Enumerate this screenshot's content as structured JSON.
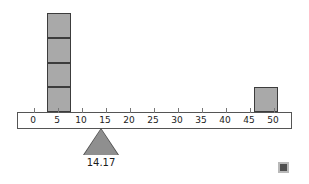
{
  "figure": {
    "type": "balance-beam-dotplot",
    "fulcrum_label": "14.17",
    "corner_marker": "filled-square-marker"
  },
  "axis": {
    "ticks": [
      "0",
      "5",
      "10",
      "15",
      "20",
      "25",
      "30",
      "35",
      "40",
      "45",
      "50"
    ],
    "min": 0,
    "max": 50,
    "step": 5
  },
  "chart_data": {
    "type": "bar",
    "title": "",
    "subtitle": "",
    "xlabel": "",
    "ylabel": "",
    "xlim": [
      -3,
      53
    ],
    "ylim": [
      0,
      4
    ],
    "grid": false,
    "legend": null,
    "categories": [
      "5",
      "48"
    ],
    "values": [
      4,
      1
    ],
    "blocks": [
      {
        "name": "stack-left",
        "x_center": 5.5,
        "x_start": 3,
        "x_end": 8,
        "count": 4
      },
      {
        "name": "stack-right",
        "x_center": 48.5,
        "x_start": 46,
        "x_end": 51,
        "count": 1
      }
    ],
    "balance_point": 14.17,
    "annotations": [
      {
        "name": "fulcrum-value",
        "text": "14.17",
        "x": 14.17
      }
    ]
  },
  "colors": {
    "block_fill": "#a9a9a9",
    "block_stroke": "#3c3c3c",
    "beam_stroke": "#555555",
    "fulcrum_fill": "#8f8f8f",
    "fulcrum_stroke": "#4a4a4a",
    "text": "#1b1b1b",
    "marker": "#4f4f4f",
    "background": "#ffffff"
  }
}
